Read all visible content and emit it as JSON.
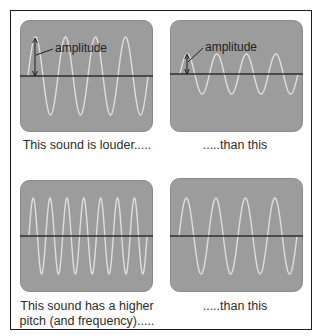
{
  "colors": {
    "screen": "#9c9c9c",
    "wave": "#dedede",
    "axis": "#2e2e2e",
    "text": "#2b2b2b",
    "border": "#1a1a1a"
  },
  "panels": [
    {
      "id": "louder",
      "label": "amplitude",
      "caption_lines": [
        "This sound is louder....."
      ],
      "cycles": 4,
      "amplitude_px": 39
    },
    {
      "id": "quieter",
      "label": "amplitude",
      "caption_lines": [
        ".....than this"
      ],
      "cycles": 4,
      "amplitude_px": 20
    },
    {
      "id": "higher-pitch",
      "caption_lines": [
        "This sound has a higher",
        "pitch (and frequency)....."
      ],
      "cycles": 7,
      "amplitude_px": 38
    },
    {
      "id": "lower-pitch",
      "caption_lines": [
        ".....than this"
      ],
      "cycles": 4,
      "amplitude_px": 38
    }
  ]
}
